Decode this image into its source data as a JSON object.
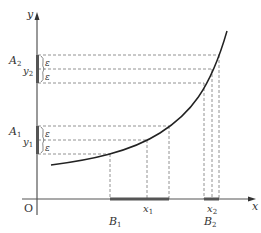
{
  "diagram": {
    "type": "function-continuity-epsilon-illustration",
    "axes": {
      "x_label": "x",
      "y_label": "y",
      "origin_label": "O"
    },
    "y_bands": [
      {
        "name": "A2",
        "label_main": "A",
        "label_sub": "2",
        "center_label_main": "y",
        "center_label_sub": "2",
        "epsilon_upper": "ε",
        "epsilon_lower": "ε"
      },
      {
        "name": "A1",
        "label_main": "A",
        "label_sub": "1",
        "center_label_main": "y",
        "center_label_sub": "1",
        "epsilon_upper": "ε",
        "epsilon_lower": "ε"
      }
    ],
    "x_intervals": [
      {
        "name": "B1",
        "label_main": "B",
        "label_sub": "1",
        "point_main": "x",
        "point_sub": "1"
      },
      {
        "name": "B2",
        "label_main": "B",
        "label_sub": "2",
        "point_main": "x",
        "point_sub": "2"
      }
    ],
    "colors": {
      "axis": "#555555",
      "curve": "#222222",
      "dashed": "#777777",
      "highlight": "#555555"
    }
  }
}
